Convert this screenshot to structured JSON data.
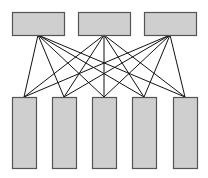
{
  "diagram": {
    "type": "bipartite-full-connection",
    "top_nodes": [
      {
        "id": "top-1",
        "label": ""
      },
      {
        "id": "top-2",
        "label": ""
      },
      {
        "id": "top-3",
        "label": ""
      }
    ],
    "bottom_nodes": [
      {
        "id": "bottom-1",
        "label": ""
      },
      {
        "id": "bottom-2",
        "label": ""
      },
      {
        "id": "bottom-3",
        "label": ""
      },
      {
        "id": "bottom-4",
        "label": ""
      },
      {
        "id": "bottom-5",
        "label": ""
      }
    ],
    "connections": "all-to-all",
    "colors": {
      "node_fill": "#cfcfcf",
      "node_stroke": "#555555",
      "edge_stroke": "#111111",
      "background": "#ffffff"
    }
  }
}
